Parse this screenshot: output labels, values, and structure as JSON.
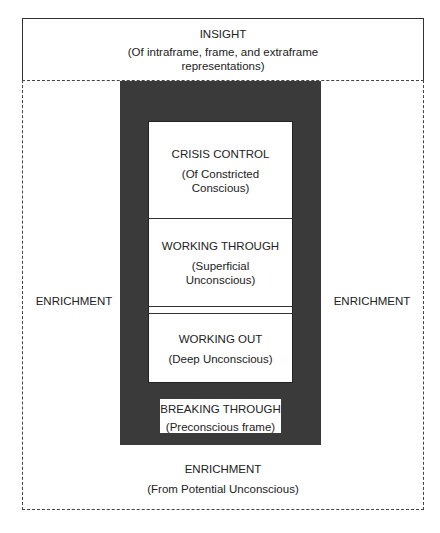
{
  "insight": {
    "title": "INSIGHT",
    "subtitle_line1": "(Of intraframe, frame, and extraframe",
    "subtitle_line2": "representations)"
  },
  "enrichment_left": "ENRICHMENT",
  "enrichment_right": "ENRICHMENT",
  "enrichment_bottom": {
    "title": "ENRICHMENT",
    "subtitle": "(From Potential Unconscious)"
  },
  "crisis_control": {
    "title": "CRISIS CONTROL",
    "subtitle_line1": "(Of Constricted",
    "subtitle_line2": "Conscious)"
  },
  "working_through": {
    "title": "WORKING THROUGH",
    "subtitle_line1": "(Superficial",
    "subtitle_line2": "Unconscious)"
  },
  "working_out": {
    "title": "WORKING OUT",
    "subtitle": "(Deep Unconscious)"
  },
  "breaking_through": {
    "title": "BREAKING THROUGH",
    "subtitle": "(Preconscious frame)"
  },
  "colors": {
    "frame": "#3a3a3a",
    "line": "#333333",
    "background": "#ffffff"
  }
}
